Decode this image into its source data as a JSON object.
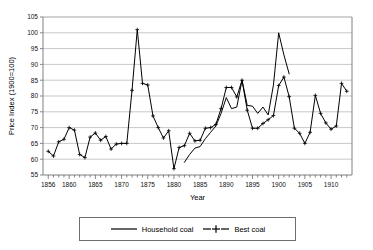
{
  "chart_data": {
    "type": "line",
    "title": "",
    "xlabel": "Year",
    "ylabel": "Price Index (1900=100)",
    "xlim": [
      1855,
      1914
    ],
    "ylim": [
      55,
      105
    ],
    "ytick_step": 5,
    "yticks": [
      55,
      60,
      65,
      70,
      75,
      80,
      85,
      90,
      95,
      100,
      105
    ],
    "xticks": [
      1856,
      1860,
      1865,
      1870,
      1875,
      1880,
      1885,
      1890,
      1895,
      1900,
      1905,
      1910
    ],
    "xtick_labels": [
      "1856",
      "1860",
      "1865",
      "1870",
      "1875",
      "1880",
      "1885",
      "1890",
      "1895",
      "1900",
      "1905",
      "1910"
    ],
    "xtick_minor_step": 1,
    "grid": "horizontal",
    "legend_position": "bottom",
    "series": [
      {
        "name": "Household coal",
        "marker": "none",
        "color": "#000000",
        "x": [
          1882,
          1883,
          1884,
          1885,
          1886,
          1887,
          1888,
          1889,
          1890,
          1891,
          1892,
          1893,
          1894,
          1895,
          1896,
          1897,
          1898,
          1899,
          1900,
          1901,
          1902
        ],
        "values": [
          59.0,
          61.5,
          63.5,
          64.0,
          66.5,
          68.5,
          70.5,
          74.5,
          79.5,
          76.0,
          76.5,
          85.0,
          77.0,
          76.8,
          74.5,
          76.5,
          74.0,
          83.5,
          100.0,
          93.0,
          87.0
        ]
      },
      {
        "name": "Best coal",
        "marker": "plus",
        "color": "#000000",
        "x": [
          1856,
          1857,
          1858,
          1859,
          1860,
          1861,
          1862,
          1863,
          1864,
          1865,
          1866,
          1867,
          1868,
          1869,
          1870,
          1871,
          1872,
          1873,
          1874,
          1875,
          1876,
          1877,
          1878,
          1879,
          1880,
          1881,
          1882,
          1883,
          1884,
          1885,
          1886,
          1887,
          1888,
          1889,
          1890,
          1891,
          1892,
          1893,
          1894,
          1895,
          1896,
          1897,
          1898,
          1899,
          1900,
          1901,
          1902,
          1903,
          1904,
          1905,
          1906,
          1907,
          1908,
          1909,
          1910,
          1911,
          1912,
          1913
        ],
        "values": [
          62.5,
          61.0,
          65.5,
          66.3,
          70.0,
          69.2,
          61.5,
          60.5,
          67.0,
          68.3,
          66.0,
          67.2,
          63.2,
          64.8,
          65.0,
          65.0,
          81.8,
          101.0,
          84.0,
          83.5,
          73.7,
          70.0,
          66.7,
          69.0,
          57.0,
          63.7,
          64.3,
          68.2,
          65.8,
          66.0,
          69.8,
          70.0,
          71.0,
          76.0,
          82.7,
          82.7,
          79.7,
          85.0,
          75.5,
          69.8,
          69.8,
          71.3,
          72.5,
          73.8,
          83.3,
          86.0,
          79.8,
          69.8,
          68.2,
          65.0,
          68.5,
          80.2,
          74.5,
          71.5,
          69.5,
          70.5,
          84.0,
          81.5
        ]
      }
    ]
  },
  "legend": {
    "items": [
      {
        "label": "Household coal",
        "marker": "none"
      },
      {
        "label": "Best coal",
        "marker": "plus"
      }
    ]
  }
}
